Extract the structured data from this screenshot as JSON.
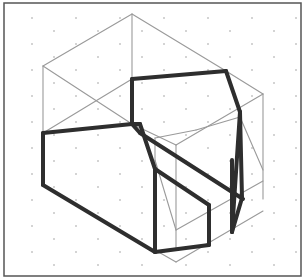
{
  "diagram": {
    "type": "isometric-drawing",
    "colors": {
      "background": "#ffffff",
      "frame": "#555555",
      "grid_dots": "#888888",
      "thin_lines": "#9a9a9a",
      "thick_lines": "#2e2e2e"
    },
    "frame": {
      "x": 4,
      "y": 3,
      "width": 297,
      "height": 273
    },
    "grid": {
      "dx": 22,
      "dy": 13,
      "origin": [
        10,
        6
      ]
    },
    "thin_lines": [
      [
        [
          132,
          14
        ],
        [
          43,
          66
        ]
      ],
      [
        [
          132,
          14
        ],
        [
          226,
          71
        ]
      ],
      [
        [
          132,
          14
        ],
        [
          132,
          79
        ]
      ],
      [
        [
          43,
          66
        ],
        [
          43,
          133
        ]
      ],
      [
        [
          43,
          66
        ],
        [
          132,
          124
        ]
      ],
      [
        [
          43,
          133
        ],
        [
          132,
          79
        ]
      ],
      [
        [
          226,
          71
        ],
        [
          263,
          94
        ]
      ],
      [
        [
          263,
          94
        ],
        [
          263,
          199
        ]
      ],
      [
        [
          263,
          94
        ],
        [
          176,
          145
        ]
      ],
      [
        [
          132,
          124
        ],
        [
          176,
          145
        ]
      ],
      [
        [
          155,
          138
        ],
        [
          155,
          250
        ]
      ],
      [
        [
          155,
          138
        ],
        [
          196,
          130
        ]
      ],
      [
        [
          196,
          130
        ],
        [
          240,
          117
        ]
      ],
      [
        [
          176,
          145
        ],
        [
          176,
          250
        ]
      ],
      [
        [
          155,
          160
        ],
        [
          176,
          230
        ]
      ],
      [
        [
          176,
          230
        ],
        [
          263,
          181
        ]
      ],
      [
        [
          155,
          250
        ],
        [
          176,
          262
        ]
      ],
      [
        [
          176,
          262
        ],
        [
          263,
          211
        ]
      ],
      [
        [
          240,
          117
        ],
        [
          263,
          170
        ]
      ]
    ],
    "thick_lines": [
      [
        [
          132,
          79
        ],
        [
          226,
          71
        ]
      ],
      [
        [
          132,
          79
        ],
        [
          132,
          124
        ]
      ],
      [
        [
          226,
          71
        ],
        [
          240,
          112
        ]
      ],
      [
        [
          240,
          112
        ],
        [
          242,
          198
        ]
      ],
      [
        [
          240,
          112
        ],
        [
          232,
          232
        ]
      ],
      [
        [
          43,
          133
        ],
        [
          132,
          124
        ]
      ],
      [
        [
          43,
          133
        ],
        [
          43,
          185
        ]
      ],
      [
        [
          43,
          185
        ],
        [
          155,
          252
        ]
      ],
      [
        [
          155,
          252
        ],
        [
          209,
          245
        ]
      ],
      [
        [
          209,
          245
        ],
        [
          209,
          205
        ]
      ],
      [
        [
          209,
          205
        ],
        [
          155,
          169
        ]
      ],
      [
        [
          132,
          124
        ],
        [
          140,
          133
        ]
      ],
      [
        [
          140,
          133
        ],
        [
          243,
          199
        ]
      ],
      [
        [
          132,
          124
        ],
        [
          140,
          124
        ]
      ],
      [
        [
          140,
          124
        ],
        [
          155,
          169
        ]
      ],
      [
        [
          155,
          169
        ],
        [
          155,
          252
        ]
      ],
      [
        [
          242,
          198
        ],
        [
          232,
          232
        ]
      ],
      [
        [
          232,
          232
        ],
        [
          232,
          160
        ]
      ]
    ]
  }
}
